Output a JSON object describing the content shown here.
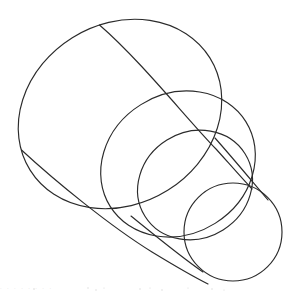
{
  "figure": {
    "medium": "pen line drawing",
    "background_color": "#ffffff",
    "ink_color": "#2b2b2b",
    "stroke_width": 1.15,
    "canvas": {
      "width": 296,
      "height": 295
    }
  },
  "geometry": {
    "rims": [
      {
        "name": "rim-1-largest",
        "label": "Largest rim (base)",
        "cx": 120,
        "cy": 114,
        "rx": 106,
        "ry": 90,
        "rotation_deg": -32,
        "order": 1
      },
      {
        "name": "rim-2-large",
        "label": "Second rim",
        "cx": 178,
        "cy": 164,
        "rx": 80,
        "ry": 70,
        "rotation_deg": -32,
        "order": 2
      },
      {
        "name": "rim-3-medium",
        "label": "Third rim",
        "cx": 195,
        "cy": 185,
        "rx": 59,
        "ry": 53,
        "rotation_deg": -32,
        "order": 3
      },
      {
        "name": "rim-4-smallest",
        "label": "Smallest rim (tip)",
        "cx": 233,
        "cy": 232,
        "rx": 49,
        "ry": 49,
        "rotation_deg": 0,
        "order": 4
      }
    ],
    "tangent_lines": [
      {
        "name": "tangent-upper-right-1",
        "label": "Upper-right contour, rim 1 to rim 2",
        "from": [
          99,
          25
        ],
        "to": [
          228,
          164
        ]
      },
      {
        "name": "tangent-lower-left-1",
        "label": "Lower-left contour, rim 1 to rim 2",
        "from": [
          22,
          151
        ],
        "to": [
          190,
          255
        ]
      },
      {
        "name": "tangent-upper-right-2",
        "label": "Upper-right contour, rim 2 to rim 4",
        "from": [
          218,
          140
        ],
        "to": [
          272,
          206
        ]
      },
      {
        "name": "tangent-lower-left-2",
        "label": "Lower-left contour, rim 3 to rim 4",
        "from": [
          132,
          218
        ],
        "to": [
          205,
          272
        ]
      }
    ],
    "tangency_notes": "All four rims share a common perspective axis running from the upper-left toward the lower-right; the straight contour lines are tangent to successive rim pairs."
  },
  "caption": {
    "artifact_text": "· · ·   · ·   ·   · ·"
  }
}
